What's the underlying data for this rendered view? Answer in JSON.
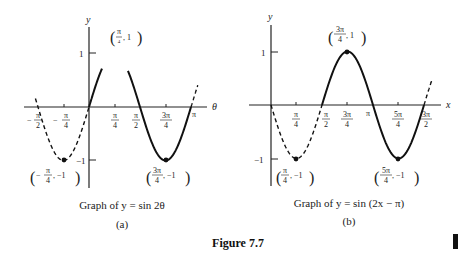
{
  "figure_label": "Figure 7.7",
  "chart_data": [
    {
      "type": "line",
      "panel": "(a)",
      "title": "Graph of y = sin 2θ",
      "function": "y = sin(2θ)",
      "xlabel": "θ",
      "ylabel": "y",
      "x_ticks": [
        "−π/2",
        "−π/4",
        "π/4",
        "π/2",
        "3π/4",
        "π"
      ],
      "x_tick_values": [
        -1.5708,
        -0.7854,
        0.7854,
        1.5708,
        2.3562,
        3.1416
      ],
      "y_ticks": [
        "1",
        "−1"
      ],
      "y_tick_values": [
        1,
        -1
      ],
      "xlim": [
        -1.6,
        3.3
      ],
      "ylim": [
        -1.2,
        1.3
      ],
      "grid": false,
      "annotations": [
        {
          "label": "(π/4, 1)",
          "x": 0.7854,
          "y": 1
        },
        {
          "label": "(−π/4, −1)",
          "x": -0.7854,
          "y": -1
        },
        {
          "label": "(3π/4, −1)",
          "x": 2.3562,
          "y": -1
        }
      ],
      "segments": [
        {
          "style": "dashed",
          "x_range": [
            -1.65,
            0
          ]
        },
        {
          "style": "solid",
          "x_range": [
            0,
            0.4
          ]
        },
        {
          "style": "solid",
          "x_range": [
            1.2,
            3.1416
          ]
        },
        {
          "style": "dashed",
          "x_range": [
            3.1416,
            3.35
          ]
        }
      ],
      "marked_points": [
        {
          "x": -0.7854,
          "y": -1
        },
        {
          "x": 2.3562,
          "y": -1
        }
      ]
    },
    {
      "type": "line",
      "panel": "(b)",
      "title": "Graph of y = sin (2x − π)",
      "function": "y = sin(2x − π)",
      "xlabel": "x",
      "ylabel": "y",
      "x_ticks": [
        "π/4",
        "π/2",
        "3π/4",
        "π",
        "5π/4",
        "3π/2"
      ],
      "x_tick_values": [
        0.7854,
        1.5708,
        2.3562,
        3.1416,
        3.927,
        4.7124
      ],
      "y_ticks": [
        "1",
        "−1"
      ],
      "y_tick_values": [
        1,
        -1
      ],
      "xlim": [
        -0.3,
        5.2
      ],
      "ylim": [
        -1.2,
        1.3
      ],
      "grid": false,
      "annotations": [
        {
          "label": "(3π/4, 1)",
          "x": 2.3562,
          "y": 1
        },
        {
          "label": "(π/4, −1)",
          "x": 0.7854,
          "y": -1
        },
        {
          "label": "(5π/4, −1)",
          "x": 3.927,
          "y": -1
        }
      ],
      "segments": [
        {
          "style": "dashed",
          "x_range": [
            0,
            1.5708
          ]
        },
        {
          "style": "solid",
          "x_range": [
            1.5708,
            4.7124
          ]
        },
        {
          "style": "dashed",
          "x_range": [
            4.7124,
            4.95
          ]
        }
      ],
      "marked_points": [
        {
          "x": 2.3562,
          "y": 1
        },
        {
          "x": 0.7854,
          "y": -1
        },
        {
          "x": 3.927,
          "y": -1
        }
      ]
    }
  ],
  "panels": {
    "a": {
      "caption": "Graph of y = sin 2θ",
      "sublabel": "(a)",
      "axis_x_label": "θ",
      "axis_y_label": "y",
      "y_tick_pos": "1",
      "y_tick_neg": "−1",
      "tick_labels": {
        "neg_pi_2": {
          "sign": "−",
          "num": "π",
          "den": "2"
        },
        "neg_pi_4": {
          "sign": "−",
          "num": "π",
          "den": "4"
        },
        "pi_4": {
          "num": "π",
          "den": "4"
        },
        "pi_2": {
          "num": "π",
          "den": "2"
        },
        "three_pi_4": {
          "num": "3π",
          "den": "4"
        },
        "pi": "π"
      },
      "point_labels": {
        "max": {
          "num": "π",
          "den": "4",
          "rest": ", 1"
        },
        "min_left": {
          "sign": "−",
          "num": "π",
          "den": "4",
          "rest": ", −1"
        },
        "min_right": {
          "num": "3π",
          "den": "4",
          "rest": ", −1"
        }
      }
    },
    "b": {
      "caption": "Graph of y = sin (2x − π)",
      "sublabel": "(b)",
      "axis_x_label": "x",
      "axis_y_label": "y",
      "y_tick_pos": "1",
      "y_tick_neg": "−1",
      "tick_labels": {
        "pi_4": {
          "num": "π",
          "den": "4"
        },
        "pi_2": {
          "num": "π",
          "den": "2"
        },
        "three_pi_4": {
          "num": "3π",
          "den": "4"
        },
        "pi": "π",
        "five_pi_4": {
          "num": "5π",
          "den": "4"
        },
        "three_pi_2": {
          "num": "3π",
          "den": "2"
        }
      },
      "point_labels": {
        "max": {
          "num": "3π",
          "den": "4",
          "rest": ", 1"
        },
        "min_left": {
          "num": "π",
          "den": "4",
          "rest": ", −1"
        },
        "min_right": {
          "num": "5π",
          "den": "4",
          "rest": ", −1"
        }
      }
    }
  }
}
